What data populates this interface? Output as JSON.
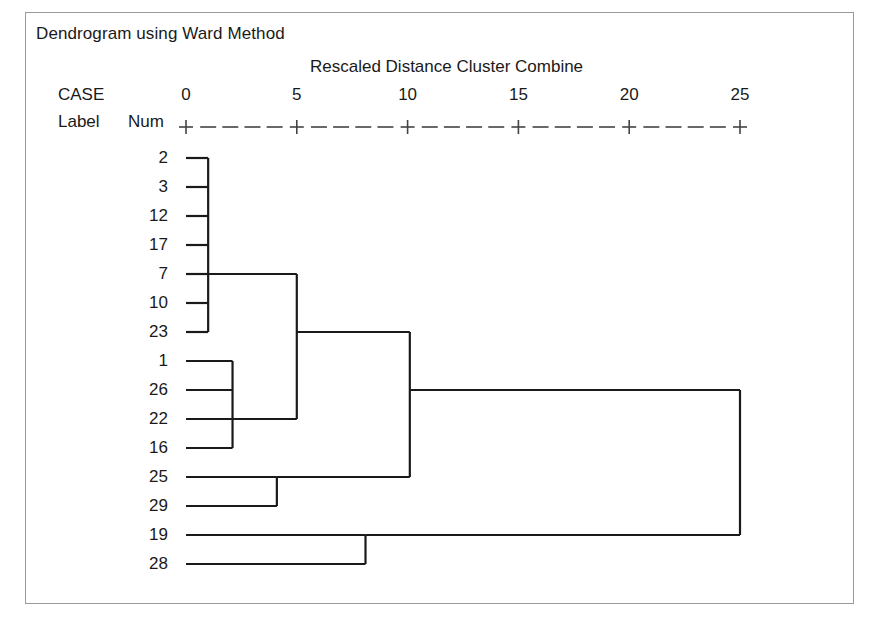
{
  "window": {
    "title": "Dendrogram using Ward Method",
    "frame_color": "#9a9a9a",
    "background": "#ffffff",
    "line_color": "#1a1a1a"
  },
  "header": {
    "title": "Dendrogram using Ward Method",
    "axis_title": "Rescaled Distance Cluster Combine",
    "case_word": "CASE",
    "label_word": "Label",
    "num_word": "Num"
  },
  "axis": {
    "tick_labels": [
      "0",
      "5",
      "10",
      "15",
      "20",
      "25"
    ],
    "tick_values": [
      0,
      5,
      10,
      15,
      20,
      25
    ],
    "min": 0,
    "max": 25,
    "ruler_glyph": "+ - - - - +"
  },
  "cases": [
    {
      "num": "2"
    },
    {
      "num": "3"
    },
    {
      "num": "12"
    },
    {
      "num": "17"
    },
    {
      "num": "7"
    },
    {
      "num": "10"
    },
    {
      "num": "23"
    },
    {
      "num": "1"
    },
    {
      "num": "26"
    },
    {
      "num": "22"
    },
    {
      "num": "16"
    },
    {
      "num": "25"
    },
    {
      "num": "29"
    },
    {
      "num": "19"
    },
    {
      "num": "28"
    }
  ],
  "chart_data": {
    "type": "dendrogram",
    "title": "Dendrogram using Ward Method",
    "xlabel": "Rescaled Distance Cluster Combine",
    "ylabel": "",
    "xlim": [
      0,
      25
    ],
    "xticks": [
      0,
      5,
      10,
      15,
      20,
      25
    ],
    "grid": false,
    "legend": "none",
    "method": "Ward Method",
    "leaf_order": [
      "2",
      "3",
      "12",
      "17",
      "7",
      "10",
      "23",
      "1",
      "26",
      "22",
      "16",
      "25",
      "29",
      "19",
      "28"
    ],
    "leaves": [
      {
        "num": "2",
        "row": 0
      },
      {
        "num": "3",
        "row": 1
      },
      {
        "num": "12",
        "row": 2
      },
      {
        "num": "17",
        "row": 3
      },
      {
        "num": "7",
        "row": 4
      },
      {
        "num": "10",
        "row": 5
      },
      {
        "num": "23",
        "row": 6
      },
      {
        "num": "1",
        "row": 7
      },
      {
        "num": "26",
        "row": 8
      },
      {
        "num": "22",
        "row": 9
      },
      {
        "num": "16",
        "row": 10
      },
      {
        "num": "25",
        "row": 11
      },
      {
        "num": "29",
        "row": 12
      },
      {
        "num": "19",
        "row": 13
      },
      {
        "num": "28",
        "row": 14
      }
    ],
    "merges": [
      {
        "id": "m1",
        "label": "cluster-2-3-12-17-7-10-23",
        "distance": 1.0,
        "members": [
          "2",
          "3",
          "12",
          "17",
          "7",
          "10",
          "23"
        ],
        "row_span": [
          0,
          6
        ],
        "stem_row": 4
      },
      {
        "id": "m2",
        "label": "cluster-1-26-22-16",
        "distance": 2.1,
        "members": [
          "1",
          "26",
          "22",
          "16"
        ],
        "row_span": [
          7,
          10
        ],
        "stem_row": 9
      },
      {
        "id": "m3",
        "label": "merge-m1-m2",
        "distance": 5.0,
        "members": [
          "m1",
          "m2"
        ],
        "row_span": [
          4,
          9
        ],
        "stem_row": 6
      },
      {
        "id": "m4",
        "label": "cluster-25-29",
        "distance": 4.1,
        "members": [
          "25",
          "29"
        ],
        "row_span": [
          11,
          12
        ],
        "stem_row": 11
      },
      {
        "id": "m5",
        "label": "merge-m3-m4",
        "distance": 10.1,
        "members": [
          "m3",
          "m4"
        ],
        "row_span": [
          6,
          11
        ],
        "stem_row": 8
      },
      {
        "id": "m6",
        "label": "cluster-19-28",
        "distance": 8.1,
        "members": [
          "19",
          "28"
        ],
        "row_span": [
          13,
          14
        ],
        "stem_row": 13
      },
      {
        "id": "m7",
        "label": "root-merge-m5-m6",
        "distance": 25.0,
        "members": [
          "m5",
          "m6"
        ],
        "row_span": [
          8,
          13
        ],
        "stem_row": 8
      }
    ]
  }
}
